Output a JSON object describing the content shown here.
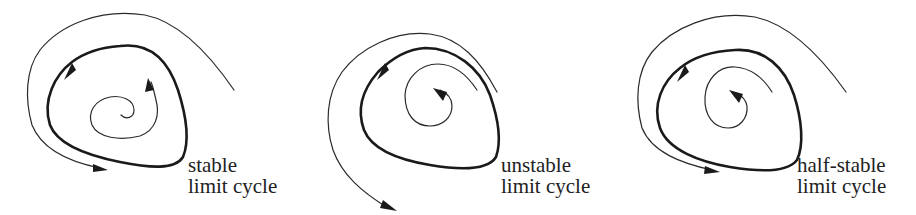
{
  "figure": {
    "panels": [
      {
        "id": "stable",
        "label_line1": "stable",
        "label_line2": "limit cycle"
      },
      {
        "id": "unstable",
        "label_line1": "unstable",
        "label_line2": "limit cycle"
      },
      {
        "id": "half-stable",
        "label_line1": "half-stable",
        "label_line2": "limit cycle"
      }
    ]
  },
  "colors": {
    "background": "#ffffff",
    "stroke": "#1a1a1a",
    "text": "#222222"
  }
}
